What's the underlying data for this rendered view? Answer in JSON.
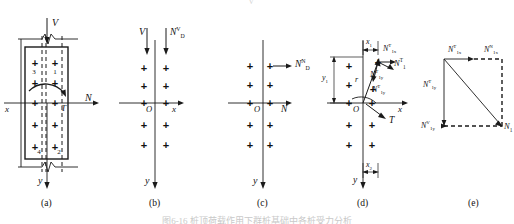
{
  "figure": {
    "type": "engineering-force-decomposition-diagram",
    "panel_count": 5,
    "captions": [
      "(a)",
      "(b)",
      "(c)",
      "(d)",
      "(e)"
    ],
    "bottom_caption_cut": "图6-16  桩顶荷载作用下群桩基础中各桩受力分析",
    "top_cut_mark": "V"
  },
  "panel_a": {
    "caption": "(a)",
    "labels": {
      "V": "V",
      "x_axis": "x",
      "y_axis": "y",
      "N_axis": "N",
      "T": "T",
      "region_1": "1",
      "region_2": "2",
      "region_3": "3",
      "region_4": "4"
    },
    "plus_rows": 5,
    "plus_cols": 2
  },
  "panel_b": {
    "caption": "(b)",
    "labels": {
      "V": "V",
      "force": {
        "base": "N",
        "sup": "V",
        "sub": "D"
      },
      "origin": "O",
      "x_axis": "x",
      "y_axis": "y"
    },
    "plus_rows": 5,
    "plus_cols": 2
  },
  "panel_c": {
    "caption": "(c)",
    "labels": {
      "force": {
        "base": "N",
        "sup": "N",
        "sub": "D"
      },
      "origin": "O",
      "x_axis": "x",
      "y_axis": "y",
      "N_axis": "N"
    },
    "plus_rows": 5,
    "plus_cols": 2
  },
  "panel_d": {
    "caption": "(d)",
    "labels": {
      "x1": {
        "base": "x",
        "sub": "1"
      },
      "x2": {
        "base": "x",
        "sub": "2"
      },
      "y1": {
        "base": "y",
        "sub": "1"
      },
      "r": "r",
      "origin": "O",
      "x_axis": "x",
      "y_axis": "y",
      "T": "T",
      "N1x_T": {
        "base": "N",
        "sub": "1x",
        "sup": "T"
      },
      "N1_T": {
        "base": "N",
        "sub": "1",
        "sup": "T"
      },
      "N1y_T": {
        "base": "N",
        "sub": "1y",
        "sup": "T"
      },
      "N1y_T2": {
        "base": "N",
        "sub": "1y",
        "sup": "T"
      }
    },
    "plus_rows": 5,
    "plus_cols": 2
  },
  "panel_e": {
    "caption": "(e)",
    "labels": {
      "top_left": {
        "base": "N",
        "sub": "1x",
        "sup": "T"
      },
      "top_right": {
        "base": "N",
        "sub": "1x",
        "sup": "N"
      },
      "left": {
        "base": "N",
        "sub": "1y",
        "sup": "T"
      },
      "bottom_left": {
        "base": "N",
        "sub": "1y",
        "sup": "V"
      },
      "bottom_right": {
        "base": "N",
        "sub": "1"
      }
    }
  },
  "colors": {
    "stroke": "#1a1a1a",
    "background": "#ffffff",
    "caption": "#111111"
  }
}
